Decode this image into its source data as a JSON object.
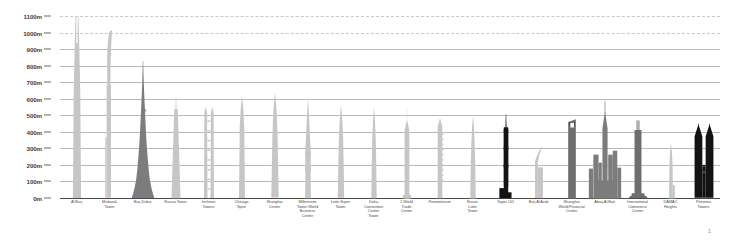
{
  "page": {
    "number": "1"
  },
  "chart_data": {
    "type": "bar",
    "title": "",
    "subtitle": "",
    "xlabel": "",
    "ylabel": "",
    "ylim": [
      0,
      1100
    ],
    "grid": true,
    "legend": "none",
    "unit": "m",
    "axis": {
      "ticks": [
        {
          "label": "1100m",
          "value": 1100
        },
        {
          "label": "1000m",
          "value": 1000
        },
        {
          "label": "900m",
          "value": 900
        },
        {
          "label": "800m",
          "value": 800
        },
        {
          "label": "700m",
          "value": 700
        },
        {
          "label": "600m",
          "value": 600
        },
        {
          "label": "500m",
          "value": 500
        },
        {
          "label": "400m",
          "value": 400
        },
        {
          "label": "300m",
          "value": 300
        },
        {
          "label": "200m",
          "value": 200
        },
        {
          "label": "100m",
          "value": 100
        },
        {
          "label": "0m",
          "value": 0
        }
      ]
    },
    "colors": {
      "light": "#c6c6c6",
      "mid": "#a8a8a8",
      "dark": "#7c7c7c",
      "darker": "#6e6e6e",
      "black": "#131313",
      "grid": "#bfbfbf",
      "axis": "#4a4a4a",
      "text": "#4b4b4b"
    },
    "categories": [
      "Al Burj",
      "Mubarak Tower",
      "Burj Dubai",
      "Russia Tower",
      "Incheon Towers",
      "Chicago Spire",
      "Shanghai Center",
      "Millennium Tower World Business Center",
      "Lotte Super Tower",
      "Doha Convention Center Tower",
      "1 World Trade Center",
      "Pentominium",
      "Busan Lotte Tower",
      "Taipei 101",
      "Burj Al Arab",
      "Shanghai World Financial Center",
      "Abraj Al Bait",
      "International Commerce Center",
      "DAMAC Heights",
      "Petronas Towers"
    ],
    "values": [
      1200,
      1014,
      828,
      612,
      587,
      610,
      632,
      600,
      555,
      551,
      541,
      516,
      510,
      509,
      321,
      492,
      601,
      484,
      335,
      452
    ],
    "bars": [
      {
        "label": "Al Burj",
        "label_lines": [
          "Al Burj"
        ],
        "height_m": 1200,
        "shape": "al-burj",
        "tone": "light"
      },
      {
        "label": "Mubarak Tower",
        "label_lines": [
          "Mubarak",
          "Tower"
        ],
        "height_m": 1014,
        "shape": "mubarak",
        "tone": "light"
      },
      {
        "label": "Burj Dubai",
        "label_lines": [
          "Burj Dubai"
        ],
        "height_m": 828,
        "shape": "burj-dubai",
        "tone": "dark"
      },
      {
        "label": "Russia Tower",
        "label_lines": [
          "Russia Tower"
        ],
        "height_m": 612,
        "shape": "russia",
        "tone": "light"
      },
      {
        "label": "Incheon Towers",
        "label_lines": [
          "Incheon",
          "Towers"
        ],
        "height_m": 587,
        "shape": "incheon",
        "tone": "light"
      },
      {
        "label": "Chicago Spire",
        "label_lines": [
          "Chicago",
          "Spire"
        ],
        "height_m": 610,
        "shape": "spire",
        "tone": "light"
      },
      {
        "label": "Shanghai Center",
        "label_lines": [
          "Shanghai",
          "Center"
        ],
        "height_m": 632,
        "shape": "shanghai-ctr",
        "tone": "light"
      },
      {
        "label": "Millennium Tower",
        "label_lines": [
          "Millennium",
          "Tower World",
          "Business",
          "Center"
        ],
        "height_m": 600,
        "shape": "millennium",
        "tone": "light"
      },
      {
        "label": "Lotte Super Tower",
        "label_lines": [
          "Lotte Super",
          "Tower"
        ],
        "height_m": 555,
        "shape": "lotte-super",
        "tone": "light"
      },
      {
        "label": "Doha Convention",
        "label_lines": [
          "Doha",
          "Convention",
          "Center",
          "Tower"
        ],
        "height_m": 551,
        "shape": "doha",
        "tone": "light"
      },
      {
        "label": "1 World Trade Center",
        "label_lines": [
          "1 World",
          "Trade",
          "Center"
        ],
        "height_m": 541,
        "shape": "wtc",
        "tone": "light"
      },
      {
        "label": "Pentominium",
        "label_lines": [
          "Pentominium"
        ],
        "height_m": 516,
        "shape": "pentominium",
        "tone": "light"
      },
      {
        "label": "Busan Lotte Tower",
        "label_lines": [
          "Busan",
          "Lotte",
          "Tower"
        ],
        "height_m": 510,
        "shape": "busan",
        "tone": "light"
      },
      {
        "label": "Taipei 101",
        "label_lines": [
          "Taipei 101"
        ],
        "height_m": 509,
        "shape": "taipei",
        "tone": "black"
      },
      {
        "label": "Burj Al Arab",
        "label_lines": [
          "Burj Al Arab"
        ],
        "height_m": 321,
        "shape": "burj-al-arab",
        "tone": "light"
      },
      {
        "label": "Shanghai World Financial Center",
        "label_lines": [
          "Shanghai",
          "World Financial",
          "Center"
        ],
        "height_m": 492,
        "shape": "swfc",
        "tone": "darker"
      },
      {
        "label": "Abraj Al Bait",
        "label_lines": [
          "Abraj Al Bait"
        ],
        "height_m": 601,
        "shape": "abraj",
        "tone": "dark"
      },
      {
        "label": "International Commerce Center",
        "label_lines": [
          "International",
          "Commerce",
          "Center"
        ],
        "height_m": 484,
        "shape": "icc",
        "tone": "darker"
      },
      {
        "label": "DAMAC Heights",
        "label_lines": [
          "DAMAC",
          "Heights"
        ],
        "height_m": 335,
        "shape": "damac",
        "tone": "light"
      },
      {
        "label": "Petronas Towers",
        "label_lines": [
          "Petronas",
          "Towers"
        ],
        "height_m": 452,
        "shape": "petronas",
        "tone": "black"
      }
    ]
  }
}
